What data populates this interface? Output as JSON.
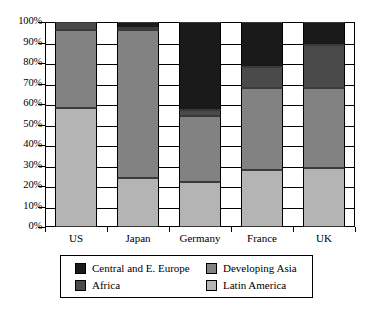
{
  "chart_data": {
    "type": "bar",
    "subtype": "stacked-percentage",
    "title": "",
    "xlabel": "",
    "ylabel": "",
    "categories": [
      "US",
      "Japan",
      "Germany",
      "France",
      "UK"
    ],
    "series": [
      {
        "name": "Latin America",
        "color": "#b4b4b4",
        "values": [
          58,
          24,
          22,
          28,
          29
        ]
      },
      {
        "name": "Developing Asia",
        "color": "#828282",
        "values": [
          38,
          72,
          32,
          40,
          39
        ]
      },
      {
        "name": "Africa",
        "color": "#4a4a4a",
        "values": [
          4,
          1,
          3,
          10,
          21
        ]
      },
      {
        "name": "Central and E. Europe",
        "color": "#1a1a1a",
        "values": [
          0,
          3,
          43,
          22,
          11
        ]
      }
    ],
    "ylim": [
      0,
      100
    ],
    "ytick_labels": [
      "0%",
      "10%",
      "20%",
      "30%",
      "40%",
      "50%",
      "60%",
      "70%",
      "80%",
      "90%",
      "100%"
    ],
    "ytick_values": [
      0,
      10,
      20,
      30,
      40,
      50,
      60,
      70,
      80,
      90,
      100
    ],
    "grid": true,
    "legend_position": "bottom",
    "legend_order": [
      "Central and E. Europe",
      "Developing Asia",
      "Africa",
      "Latin America"
    ]
  },
  "legend": {
    "items": [
      {
        "label": "Central and E. Europe",
        "color": "#1a1a1a"
      },
      {
        "label": "Developing Asia",
        "color": "#828282"
      },
      {
        "label": "Africa",
        "color": "#4a4a4a"
      },
      {
        "label": "Latin America",
        "color": "#b4b4b4"
      }
    ]
  }
}
